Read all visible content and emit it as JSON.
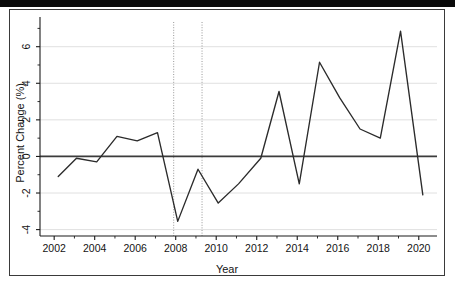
{
  "figure": {
    "has_outer_frame": true,
    "scan_artifact_bar": true,
    "background_color": "#ffffff",
    "line_color": "#2b2b2b",
    "zero_line_color": "#3c3c3c",
    "grid_color": "#d8d8d8",
    "event_line_color": "#8c8c8c",
    "axis_color": "#1a1a1a"
  },
  "chart_data": {
    "type": "line",
    "title": "",
    "xlabel": "Year",
    "ylabel": "Percent Change (%)",
    "xlim": [
      2001.3,
      2020.9
    ],
    "ylim": [
      -4.35,
      7.35
    ],
    "grid": true,
    "grid_axis": "y",
    "legend": "none",
    "x_ticks": [
      2002,
      2004,
      2006,
      2008,
      2010,
      2012,
      2014,
      2016,
      2018,
      2020
    ],
    "x_tick_labels": [
      "2002",
      "2004",
      "2006",
      "2008",
      "2010",
      "2012",
      "2014",
      "2016",
      "2018",
      "2020"
    ],
    "x_minor_ticks": [
      2003,
      2005,
      2007,
      2009,
      2011,
      2013,
      2015,
      2017,
      2019
    ],
    "y_ticks": [
      -4,
      -2,
      0,
      2,
      4,
      6
    ],
    "y_tick_labels": [
      "-4",
      "-2",
      "0",
      "2",
      "4",
      "6"
    ],
    "y_minor_ticks": [
      -3,
      -1,
      1,
      3,
      5,
      7
    ],
    "reference_lines": [
      {
        "name": "zero-line",
        "orientation": "horizontal",
        "value": 0,
        "style": "solid"
      },
      {
        "name": "recession-start",
        "orientation": "vertical",
        "value": 2007.9,
        "style": "dotted"
      },
      {
        "name": "recession-end",
        "orientation": "vertical",
        "value": 2009.3,
        "style": "dotted"
      }
    ],
    "x": [
      2002.2,
      2003.1,
      2004.1,
      2005.1,
      2006.1,
      2007.1,
      2008.1,
      2009.1,
      2010.1,
      2011.1,
      2012.2,
      2013.1,
      2014.1,
      2015.1,
      2016.1,
      2017.1,
      2018.1,
      2019.1,
      2020.2
    ],
    "values": [
      -1.1,
      -0.1,
      -0.3,
      1.1,
      0.85,
      1.3,
      -3.55,
      -0.7,
      -2.55,
      -1.5,
      -0.1,
      3.55,
      -1.5,
      5.15,
      3.2,
      1.5,
      1.0,
      6.85,
      -2.1
    ],
    "series": [
      {
        "name": "percent-change",
        "values": [
          -1.1,
          -0.1,
          -0.3,
          1.1,
          0.85,
          1.3,
          -3.55,
          -0.7,
          -2.55,
          -1.5,
          -0.1,
          3.55,
          -1.5,
          5.15,
          3.2,
          1.5,
          1.0,
          6.85,
          -2.1
        ]
      }
    ]
  }
}
